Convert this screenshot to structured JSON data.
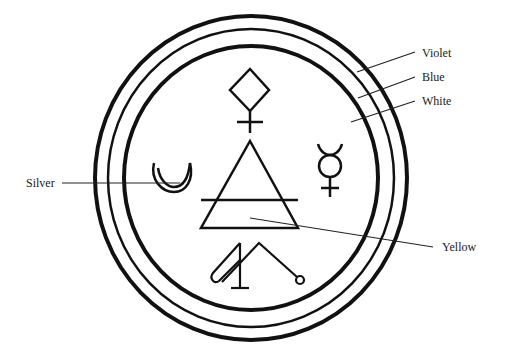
{
  "diagram": {
    "rings": [
      {
        "id": "outer",
        "label": "Violet"
      },
      {
        "id": "middle",
        "label": "Blue"
      },
      {
        "id": "inner",
        "label": "White"
      }
    ],
    "symbols": [
      {
        "id": "copper-venus",
        "name": "diamond-cross-symbol",
        "position": "top"
      },
      {
        "id": "moon",
        "name": "crescent-moon-symbol",
        "position": "left",
        "label": "Silver"
      },
      {
        "id": "mercury",
        "name": "mercury-symbol",
        "position": "right"
      },
      {
        "id": "air",
        "name": "air-triangle-symbol",
        "position": "center",
        "label": "Yellow"
      },
      {
        "id": "bottom-sigil",
        "name": "sigil-symbol",
        "position": "bottom"
      }
    ],
    "labels": {
      "violet": "Violet",
      "blue": "Blue",
      "white": "White",
      "silver": "Silver",
      "yellow": "Yellow"
    },
    "colors": {
      "stroke": "#111111",
      "background": "#ffffff",
      "text": "#222222"
    }
  }
}
